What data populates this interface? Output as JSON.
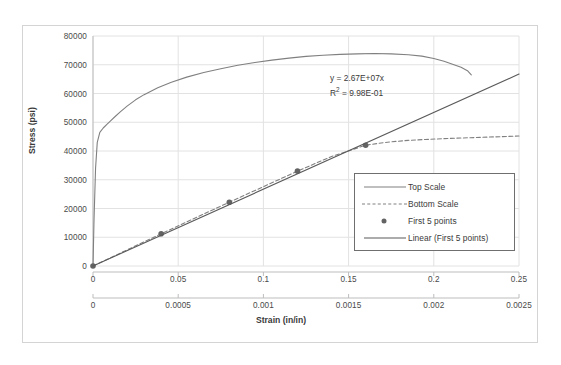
{
  "chart_data": {
    "type": "line",
    "title": "",
    "xlabel": "Strain (in/in)",
    "ylabel": "Stress (psi)",
    "ylim": [
      0,
      80000
    ],
    "yticks": [
      "0",
      "10000",
      "20000",
      "30000",
      "40000",
      "50000",
      "60000",
      "70000",
      "80000"
    ],
    "ytick_values": [
      0,
      10000,
      20000,
      30000,
      40000,
      50000,
      60000,
      70000,
      80000
    ],
    "grid": true,
    "legend_position": "lower-right-inside",
    "axes": {
      "top_x": {
        "label": "",
        "xlim": [
          0,
          0.25
        ],
        "ticks": [
          "0",
          "0.05",
          "0.1",
          "0.15",
          "0.2",
          "0.25"
        ],
        "tick_values": [
          0,
          0.05,
          0.1,
          0.15,
          0.2,
          0.25
        ]
      },
      "bottom_x": {
        "label": "Strain (in/in)",
        "xlim": [
          0,
          0.0025
        ],
        "ticks": [
          "0",
          "0.0005",
          "0.001",
          "0.0015",
          "0.002",
          "0.0025"
        ],
        "tick_values": [
          0,
          0.0005,
          0.001,
          0.0015,
          0.002,
          0.0025
        ]
      }
    },
    "annotations": [
      {
        "name": "trendline-equation",
        "line1": "y = 2.67E+07x",
        "line2_prefix": "R",
        "line2_sup": "2",
        "line2_suffix": " = 9.98E-01"
      }
    ],
    "series": [
      {
        "name": "Top Scale",
        "style": "solid",
        "color": "#808080",
        "axis": "top_x",
        "x": [
          0,
          0.0006,
          0.0015,
          0.0025,
          0.004,
          0.006,
          0.008,
          0.01,
          0.013,
          0.016,
          0.02,
          0.025,
          0.03,
          0.038,
          0.046,
          0.055,
          0.065,
          0.075,
          0.085,
          0.095,
          0.105,
          0.115,
          0.125,
          0.135,
          0.145,
          0.155,
          0.165,
          0.175,
          0.185,
          0.193,
          0.2,
          0.206,
          0.211,
          0.216,
          0.22,
          0.222
        ],
        "y": [
          0,
          16000,
          34000,
          43000,
          46500,
          48000,
          49200,
          50300,
          52000,
          53600,
          55600,
          57800,
          59600,
          62000,
          63900,
          65700,
          67300,
          68600,
          69800,
          70800,
          71600,
          72300,
          72900,
          73300,
          73600,
          73800,
          73900,
          73800,
          73500,
          73000,
          72200,
          71200,
          70200,
          69100,
          67800,
          66500
        ]
      },
      {
        "name": "Bottom Scale",
        "style": "dashed",
        "color": "#808080",
        "axis": "bottom_x",
        "x": [
          0,
          0.0002,
          0.0004,
          0.0006,
          0.0008,
          0.001,
          0.0012,
          0.0014,
          0.0016,
          0.00168,
          0.00175,
          0.00185,
          0.00195,
          0.0021,
          0.0022,
          0.00235,
          0.0025
        ],
        "y": [
          0,
          5600,
          11200,
          16700,
          22200,
          27600,
          33000,
          38100,
          42000,
          42700,
          43200,
          43700,
          44000,
          44400,
          44600,
          44900,
          45200
        ]
      },
      {
        "name": "First 5 points",
        "style": "markers",
        "color": "#636363",
        "axis": "bottom_x",
        "x": [
          0,
          0.0004,
          0.0008,
          0.0012,
          0.0016
        ],
        "y": [
          0,
          11200,
          22200,
          33000,
          42000
        ]
      },
      {
        "name": "Linear (First 5 points)",
        "style": "solid",
        "color": "#5a5a5a",
        "axis": "bottom_x",
        "slope": 26700000,
        "intercept": 0,
        "x": [
          0,
          0.0025
        ],
        "y": [
          0,
          66750
        ]
      }
    ]
  },
  "legend": {
    "items": [
      {
        "label": "Top Scale",
        "key": "solid-line"
      },
      {
        "label": "Bottom Scale",
        "key": "dashed-line"
      },
      {
        "label": "First 5 points",
        "key": "marker-dot"
      },
      {
        "label": "Linear (First 5 points)",
        "key": "solid-line-dark"
      }
    ]
  }
}
